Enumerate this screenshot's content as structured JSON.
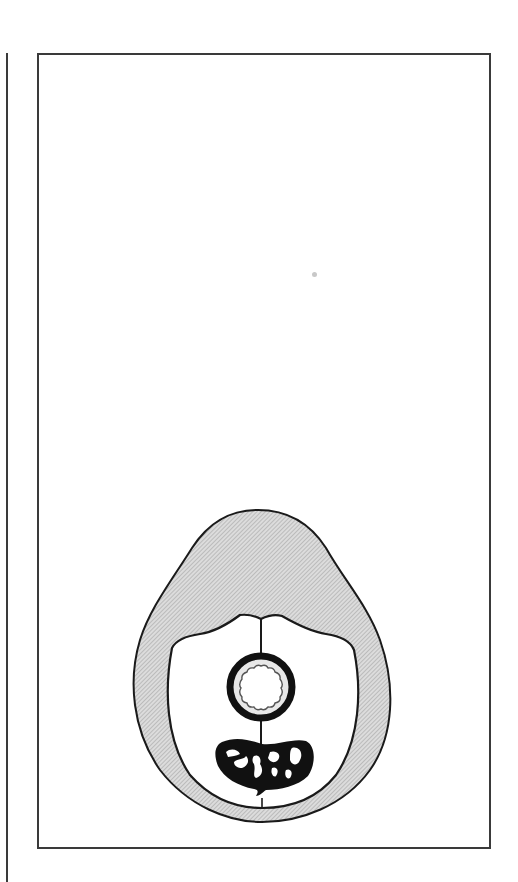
{
  "figure": {
    "type": "cross-section illustration",
    "description": "Schematic cross-section: hatched outer layer enclosing a white cavity divided by a vertical midline septum, with a thick-walled ring (wavy lumen) above a black kidney-shaped mass containing white irregular spots.",
    "colors": {
      "ink": "#1a1a1a",
      "frame": "#3a3a3a",
      "hatch_fill": "#d9d9d9",
      "hatch_line": "#9a9a9a",
      "cavity": "#ffffff",
      "ring_gap": "#e6e6e6",
      "speck": "#c8c8c8"
    },
    "components": [
      {
        "id": "outer-layer",
        "label": "hatched outer layer"
      },
      {
        "id": "inner-cavity",
        "label": "inner cavity"
      },
      {
        "id": "midline-septum",
        "label": "midline septum"
      },
      {
        "id": "ring-structure",
        "label": "thick-walled ring with wavy lumen"
      },
      {
        "id": "dark-mass",
        "label": "black kidney-shaped mass with light spots"
      }
    ]
  }
}
